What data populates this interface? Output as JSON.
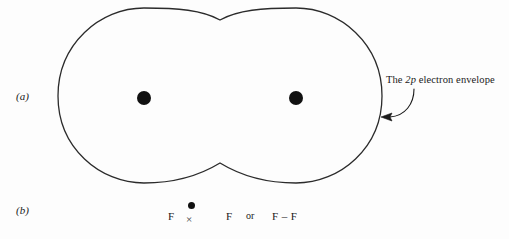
{
  "figure": {
    "background_color": "#fdfdfd",
    "stroke_color": "#2b2b2b"
  },
  "panels": [
    {
      "id": "a",
      "label": "(a)",
      "description": "Orbital overlap diagram of F2 showing the 2p electron envelope enclosing two nuclei"
    },
    {
      "id": "b",
      "label": "(b)",
      "description": "Lewis dot-and-cross structure of the fluorine molecule"
    }
  ],
  "panel_a": {
    "label": "(a)",
    "annotation": {
      "text_before": "The ",
      "term": "2p",
      "text_after": " electron envelope",
      "full_text": "The 2p electron envelope"
    },
    "nuclei": [
      {
        "name": "left-nucleus",
        "cx": 144,
        "cy": 98,
        "r": 7
      },
      {
        "name": "right-nucleus",
        "cx": 296,
        "cy": 98,
        "r": 7
      }
    ],
    "envelope": {
      "left_edge_x": 58,
      "right_edge_x": 382,
      "top_y": 8,
      "bottom_y": 183,
      "waist_top_y": 20,
      "waist_bottom_y": 163,
      "center_x": 220
    },
    "leader_arrow": {
      "tip_x": 383,
      "tip_y": 117,
      "tail_x": 413,
      "tail_y": 89
    }
  },
  "panel_b": {
    "label": "(b)",
    "atom_left": "F",
    "atom_right": "F",
    "conjunction": "or",
    "formula": "F – F",
    "shared_pair": {
      "dot_symbol": "electron-dot",
      "cross_symbol": "×"
    }
  }
}
